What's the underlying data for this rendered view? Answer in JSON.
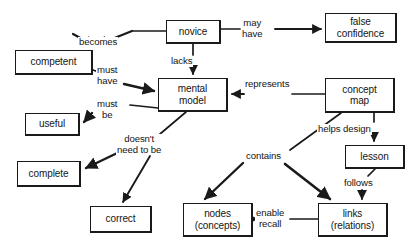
{
  "diagram": {
    "background": "#ffffff",
    "stroke": "#1a1a1a",
    "nodes": [
      {
        "id": "novice",
        "label": "novice",
        "x": 166,
        "y": 20,
        "w": 55,
        "h": 24
      },
      {
        "id": "false_confidence",
        "label": "false\nconfidence",
        "x": 325,
        "y": 13,
        "w": 72,
        "h": 30
      },
      {
        "id": "competent",
        "label": "competent",
        "x": 15,
        "y": 50,
        "w": 78,
        "h": 25
      },
      {
        "id": "mental_model",
        "label": "mental\nmodel",
        "x": 158,
        "y": 78,
        "w": 70,
        "h": 34
      },
      {
        "id": "concept_map",
        "label": "concept\nmap",
        "x": 325,
        "y": 78,
        "w": 70,
        "h": 35
      },
      {
        "id": "useful",
        "label": "useful",
        "x": 25,
        "y": 113,
        "w": 55,
        "h": 23
      },
      {
        "id": "lesson",
        "label": "lesson",
        "x": 345,
        "y": 145,
        "w": 60,
        "h": 24
      },
      {
        "id": "complete",
        "label": "complete",
        "x": 17,
        "y": 161,
        "w": 64,
        "h": 26
      },
      {
        "id": "correct",
        "label": "correct",
        "x": 90,
        "y": 206,
        "w": 62,
        "h": 27
      },
      {
        "id": "nodes_concepts",
        "label": "nodes\n(concepts)",
        "x": 183,
        "y": 203,
        "w": 70,
        "h": 34
      },
      {
        "id": "links_relations",
        "label": "links\n(relations)",
        "x": 318,
        "y": 203,
        "w": 70,
        "h": 34
      }
    ],
    "edges": [
      {
        "id": "e_becomes",
        "label": "becomes",
        "from": "novice",
        "to": "competent",
        "label_x": 78,
        "label_y": 37
      },
      {
        "id": "e_may_have",
        "label": "may\nhave",
        "from": "novice",
        "to": "false_confidence",
        "label_x": 245,
        "label_y": 18
      },
      {
        "id": "e_lacks",
        "label": "lacks",
        "from": "novice",
        "to": "mental_model",
        "label_x": 170,
        "label_y": 57
      },
      {
        "id": "e_must_have",
        "label": "must\nhave",
        "from": "competent",
        "to": "mental_model",
        "label_x": 95,
        "label_y": 65
      },
      {
        "id": "e_represents",
        "label": "represents",
        "from": "concept_map",
        "to": "mental_model",
        "label_x": 248,
        "label_y": 79
      },
      {
        "id": "e_must_be",
        "label": "must\nbe",
        "from": "mental_model",
        "to": "useful",
        "label_x": 96,
        "label_y": 98
      },
      {
        "id": "e_doesnt_need",
        "label": "doesn't\nneed to be",
        "from": "mental_model",
        "to": "complete and correct",
        "label_x": 120,
        "label_y": 134
      },
      {
        "id": "e_helps_design",
        "label": "helps design",
        "from": "concept_map",
        "to": "lesson",
        "label_x": 317,
        "label_y": 125
      },
      {
        "id": "e_contains",
        "label": "contains",
        "from": "concept_map",
        "to": "nodes and links",
        "label_x": 249,
        "label_y": 152
      },
      {
        "id": "e_follows",
        "label": "follows",
        "from": "lesson",
        "to": "links_relations",
        "label_x": 345,
        "label_y": 179
      },
      {
        "id": "e_enable_recall",
        "label": "enable\nrecall",
        "from": "links_relations",
        "to": "nodes_concepts",
        "label_x": 257,
        "label_y": 209
      }
    ]
  }
}
